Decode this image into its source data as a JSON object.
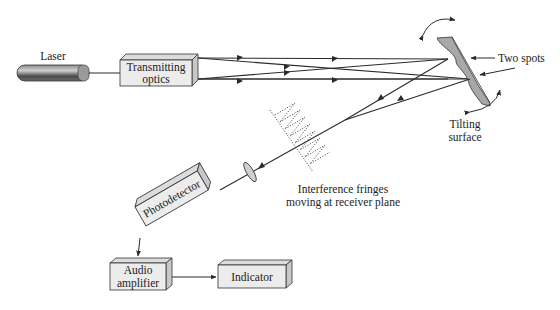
{
  "diagram": {
    "components": {
      "laser": {
        "label": "Laser"
      },
      "transmitting_optics": {
        "line1": "Transmitting",
        "line2": "optics"
      },
      "two_spots": {
        "label": "Two spots"
      },
      "tilting_surface": {
        "line1": "Tilting",
        "line2": "surface"
      },
      "fringes": {
        "line1": "Interference fringes",
        "line2": "moving at receiver plane"
      },
      "photodetector": {
        "label": "Photodetector"
      },
      "audio_amplifier": {
        "line1": "Audio",
        "line2": "amplifier"
      },
      "indicator": {
        "label": "Indicator"
      }
    },
    "colors": {
      "stroke": "#2a2a2a",
      "box_fill": "#ececec",
      "box_side": "#c8c8c8",
      "box_top": "#dcdcdc",
      "mirror_fill": "#a8a8a8",
      "laser_dark": "#555555"
    },
    "edges": [
      {
        "from": "laser",
        "to": "transmitting_optics"
      },
      {
        "from": "transmitting_optics",
        "to": "tilting_surface",
        "note": "two crossing beams"
      },
      {
        "from": "tilting_surface",
        "to": "photodetector",
        "note": "reflected beams via lens"
      },
      {
        "from": "photodetector",
        "to": "audio_amplifier"
      },
      {
        "from": "audio_amplifier",
        "to": "indicator"
      }
    ]
  }
}
